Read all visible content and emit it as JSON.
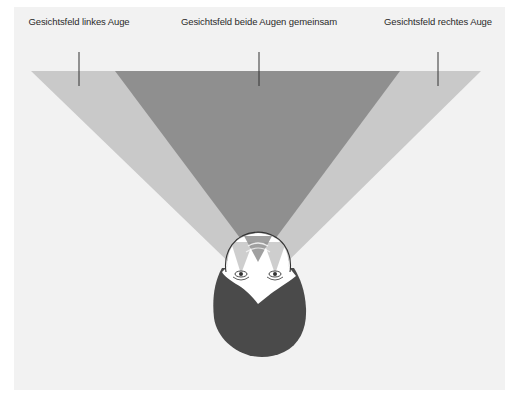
{
  "labels": {
    "left": "Gesichtsfeld linkes Auge",
    "center": "Gesichtsfeld beide Augen gemeinsam",
    "right": "Gesichtsfeld rechtes Auge"
  },
  "colors": {
    "background": "#f2f2f2",
    "monocular_field": "#c9c9c9",
    "binocular_field": "#8f8f8f",
    "hair": "#4a4a4a",
    "face": "#ffffff",
    "outline": "#333333"
  }
}
